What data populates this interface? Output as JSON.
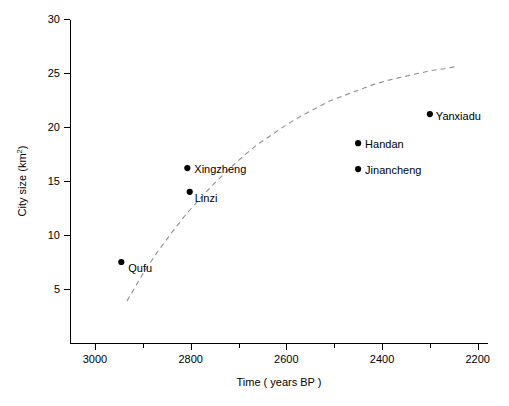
{
  "chart_data": {
    "type": "scatter",
    "title": "",
    "xlabel": "Time ( years BP )",
    "ylabel": "City size (km2)",
    "ylabel_base": "City size (km",
    "ylabel_sup": "2",
    "ylabel_close": ")",
    "xlim": [
      3050,
      2180
    ],
    "ylim": [
      2.5,
      30.5
    ],
    "x_reversed": true,
    "grid": false,
    "legend": "none",
    "xticks": [
      3000,
      2800,
      2600,
      2400,
      2200
    ],
    "xtick_labels": [
      "3000",
      "2800",
      "2600",
      "2400",
      "2200"
    ],
    "x_minor_ticks": [
      2900,
      2700,
      2500,
      2300
    ],
    "yticks": [
      5,
      10,
      15,
      20,
      25,
      30
    ],
    "ytick_labels": [
      "5",
      "10",
      "15",
      "20",
      "25",
      "30"
    ],
    "points": [
      {
        "label": "Qufu",
        "x": 2945,
        "y": 7.5,
        "label_dx": 7,
        "label_dy": 10
      },
      {
        "label": "Xingzheng",
        "x": 2807,
        "y": 16.2,
        "label_dx": 7,
        "label_dy": 5
      },
      {
        "label": "Linzi",
        "x": 2802,
        "y": 14.0,
        "label_dx": 5,
        "label_dy": 10
      },
      {
        "label": "Jinancheng",
        "x": 2450,
        "y": 16.1,
        "label_dx": 7,
        "label_dy": 5
      },
      {
        "label": "Handan",
        "x": 2450,
        "y": 18.5,
        "label_dx": 7,
        "label_dy": 5
      },
      {
        "label": "Yanxiadu",
        "x": 2300,
        "y": 21.2,
        "label_dx": 6,
        "label_dy": 6
      }
    ],
    "series": [
      {
        "name": "city-sizes",
        "type": "scatter",
        "x": [
          2945,
          2807,
          2802,
          2450,
          2450,
          2300
        ],
        "values": [
          7.5,
          16.2,
          14.0,
          16.1,
          18.5,
          21.2
        ]
      },
      {
        "name": "logistic-trend",
        "type": "line",
        "style": "dashed",
        "color": "#8e8e8e",
        "asymptote": 25.7,
        "x": [
          2933,
          2900,
          2870,
          2840,
          2810,
          2780,
          2750,
          2720,
          2690,
          2660,
          2630,
          2600,
          2570,
          2540,
          2510,
          2480,
          2450,
          2420,
          2390,
          2360,
          2330,
          2300,
          2270,
          2245
        ],
        "values": [
          3.9,
          6.4,
          8.4,
          10.2,
          11.9,
          13.4,
          14.8,
          16.1,
          17.3,
          18.4,
          19.3,
          20.2,
          21.0,
          21.7,
          22.4,
          22.9,
          23.4,
          23.9,
          24.3,
          24.6,
          24.9,
          25.2,
          25.4,
          25.6
        ]
      }
    ]
  }
}
